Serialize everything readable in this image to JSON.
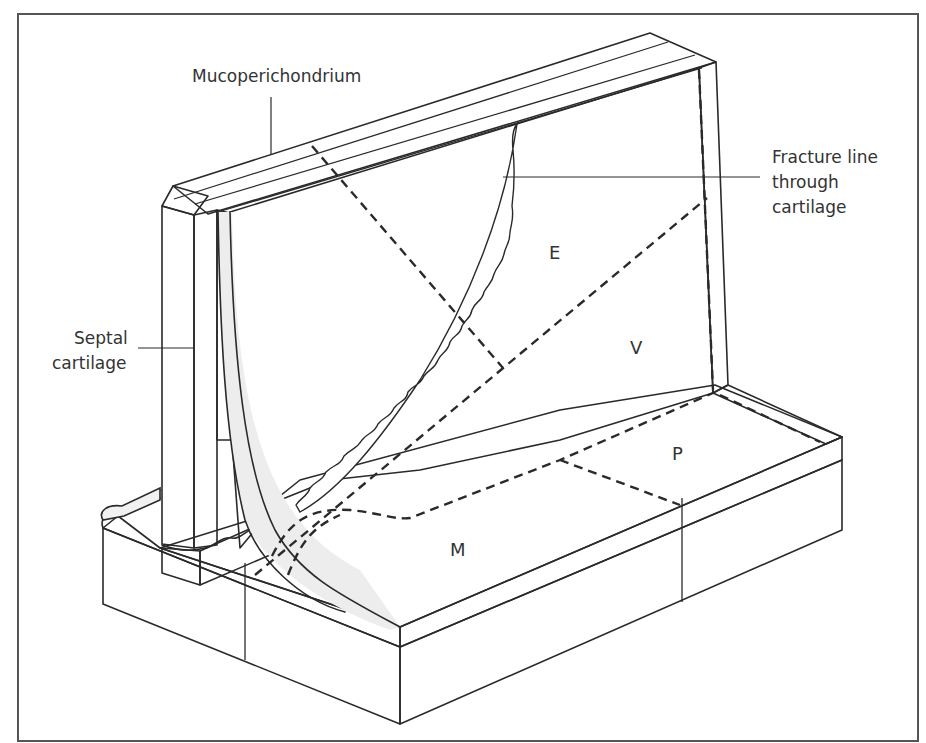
{
  "figure": {
    "colors": {
      "face_gray": "#d9d9d9",
      "light_gray": "#ececec",
      "white": "#ffffff",
      "line": "#2a2a2a",
      "frame": "#555555"
    },
    "labels": {
      "mucoperichondrium": "Mucoperichondrium",
      "fracture_line_1": "Fracture line",
      "fracture_line_2": "through",
      "fracture_line_3": "cartilage",
      "septal_1": "Septal",
      "septal_2": "cartilage"
    },
    "regions": {
      "E": "E",
      "V": "V",
      "P": "P",
      "M": "M"
    }
  }
}
